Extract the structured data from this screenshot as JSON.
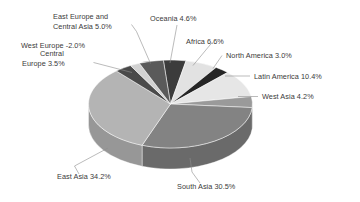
{
  "chart_data": {
    "type": "pie",
    "title": "",
    "subtitle": "",
    "xlabel": "",
    "ylabel": "",
    "legend_position": "none",
    "grid": false,
    "style": "3d-pie-grayscale",
    "value_unit": "%",
    "categories": [
      "Oceania",
      "Africa",
      "North America",
      "Latin America",
      "West Asia",
      "South Asia",
      "East Asia",
      "Central Europe",
      "West Europe",
      "East Europe and Central Asia"
    ],
    "values": [
      4.6,
      6.6,
      3.0,
      10.4,
      4.2,
      30.5,
      34.2,
      3.5,
      -2.0,
      5.0
    ],
    "slices": [
      {
        "label": "Oceania",
        "value": 4.6,
        "display": "Oceania 4.6%",
        "color": "#3c3c3c",
        "side_color": "#2a2a2a"
      },
      {
        "label": "Africa",
        "value": 6.6,
        "display": "Africa 6.6%",
        "color": "#e2e2e2",
        "side_color": "#c4c4c4"
      },
      {
        "label": "North America",
        "value": 3.0,
        "display": "North America 3.0%",
        "color": "#262626",
        "side_color": "#181818"
      },
      {
        "label": "Latin America",
        "value": 10.4,
        "display": "Latin America 10.4%",
        "color": "#e6e6e6",
        "side_color": "#c8c8c8"
      },
      {
        "label": "West Asia",
        "value": 4.2,
        "display": "West Asia 4.2%",
        "color": "#9a9a9a",
        "side_color": "#7d7d7d"
      },
      {
        "label": "South Asia",
        "value": 30.5,
        "display": "South Asia 30.5%",
        "color": "#838383",
        "side_color": "#6a6a6a"
      },
      {
        "label": "East Asia",
        "value": 34.2,
        "display": "East Asia 34.2%",
        "color": "#b4b4b4",
        "side_color": "#979797"
      },
      {
        "label": "Central Europe",
        "value": 3.5,
        "display": "Central Europe 3.5%",
        "color": "#4a4a4a",
        "side_color": "#343434"
      },
      {
        "label": "West Europe",
        "value": -2.0,
        "display": "West Europe -2.0%",
        "color": "#d2d2d2",
        "side_color": "#b2b2b2"
      },
      {
        "label": "East Europe and Central Asia",
        "value": 5.0,
        "display": "East Europe and Central Asia 5.0%",
        "color": "#5a5a5a",
        "side_color": "#414141"
      }
    ]
  },
  "labels": {
    "east_europe_central_asia_line1": "East Europe and",
    "east_europe_central_asia_line2": "Central Asia 5.0%",
    "oceania": "Oceania 4.6%",
    "west_europe": "West Europe -2.0%",
    "africa": "Africa 6.6%",
    "central_europe_line1": "Central",
    "central_europe_line2": "Europe 3.5%",
    "north_america": "North America 3.0%",
    "latin_america": "Latin America 10.4%",
    "west_asia": "West Asia 4.2%",
    "east_asia": "East Asia 34.2%",
    "south_asia": "South Asia 30.5%"
  },
  "colors": {
    "background": "#ffffff",
    "text": "#3a3a3a",
    "leader_line": "#8d8d8d"
  }
}
